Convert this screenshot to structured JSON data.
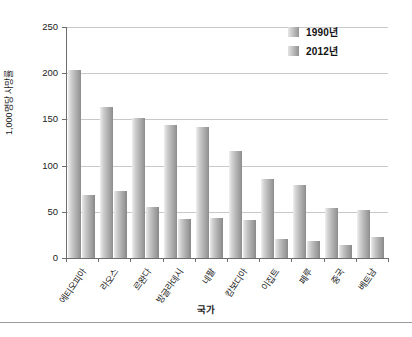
{
  "chart_data": {
    "type": "bar",
    "title": "",
    "xlabel": "국가",
    "ylabel": "1,000명당 사망률",
    "ylim": [
      0,
      250
    ],
    "yticks": [
      0,
      50,
      100,
      150,
      200,
      250
    ],
    "grid": true,
    "legend_position": "top-right",
    "categories": [
      "에티오피아",
      "라오스",
      "르완다",
      "방글라데시",
      "네팔",
      "캄보디아",
      "이집트",
      "페루",
      "중국",
      "베트남"
    ],
    "series": [
      {
        "name": "1990년",
        "values": [
          203,
          163,
          151,
          144,
          142,
          116,
          86,
          79,
          54,
          52
        ]
      },
      {
        "name": "2012년",
        "values": [
          68,
          72,
          55,
          42,
          43,
          41,
          21,
          18,
          14,
          23
        ]
      }
    ]
  },
  "legend": {
    "items": [
      {
        "label": "1990년"
      },
      {
        "label": "2012년"
      }
    ]
  }
}
